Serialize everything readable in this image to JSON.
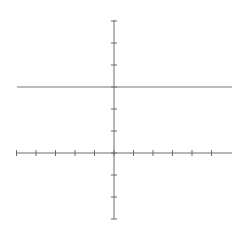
{
  "chart_data": {
    "type": "line",
    "title": "",
    "xlabel": "",
    "ylabel": "",
    "xlim": [
      -5,
      6
    ],
    "ylim": [
      -3,
      6
    ],
    "x_ticks": [
      -5,
      -4,
      -3,
      -2,
      -1,
      0,
      1,
      2,
      3,
      4,
      5
    ],
    "y_ticks": [
      -3,
      -2,
      -1,
      0,
      1,
      2,
      3,
      4,
      5,
      6
    ],
    "tick_labels_visible": false,
    "grid": false,
    "legend": null,
    "series": [
      {
        "name": "y = 3",
        "equation": "y = 3",
        "x": [
          -5,
          6
        ],
        "y": [
          3,
          3
        ]
      }
    ]
  },
  "style": {
    "axis_color": "#6e6e6e",
    "line_color": "#7a7a7a",
    "background": "#ffffff"
  },
  "layout": {
    "origin_px": [
      114,
      153
    ],
    "x_unit_px": 19.5,
    "y_unit_px": 22,
    "x_axis_px": [
      17,
      232
    ],
    "y_axis_px": [
      20,
      219
    ]
  }
}
